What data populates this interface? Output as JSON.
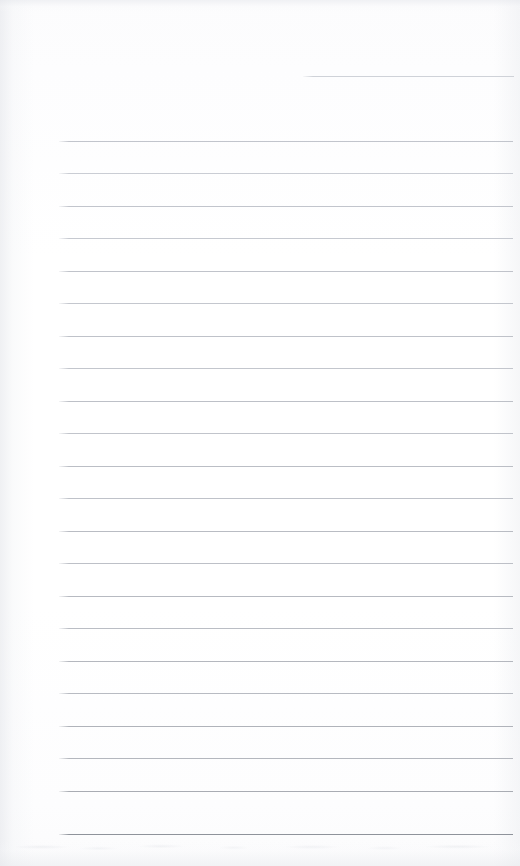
{
  "document": {
    "kind": "scanned-ruled-notepad-page",
    "page_label": "",
    "body_text": "",
    "width_px": 520,
    "height_px": 866,
    "background_color": "#ffffff",
    "paper_tone_color": "#fdfdfe",
    "rule_color": "#b9bcc4",
    "rule_color_dark": "#8f939b",
    "rule_color_light": "#cfd2d8"
  },
  "ruling": {
    "left_x": 59,
    "right_x": 512,
    "spacing_px": 32.5,
    "thickness_px": 1,
    "count": 23,
    "lines": [
      {
        "name": "rule-top-partial",
        "y": 76,
        "x": 303,
        "right": 514,
        "color": "#cfd2d8"
      },
      {
        "name": "rule-1",
        "y": 141,
        "x": 59,
        "right": 513,
        "color": "#c2c5cc"
      },
      {
        "name": "rule-2",
        "y": 173,
        "x": 59,
        "right": 513,
        "color": "#cacdd4"
      },
      {
        "name": "rule-3",
        "y": 206,
        "x": 59,
        "right": 513,
        "color": "#c2c5cc"
      },
      {
        "name": "rule-4",
        "y": 238,
        "x": 59,
        "right": 513,
        "color": "#c6c9d0"
      },
      {
        "name": "rule-5",
        "y": 271,
        "x": 59,
        "right": 513,
        "color": "#c0c3ca"
      },
      {
        "name": "rule-6",
        "y": 303,
        "x": 59,
        "right": 513,
        "color": "#c4c7ce"
      },
      {
        "name": "rule-7",
        "y": 336,
        "x": 59,
        "right": 513,
        "color": "#bfc2c9"
      },
      {
        "name": "rule-8",
        "y": 368,
        "x": 59,
        "right": 513,
        "color": "#c3c6cd"
      },
      {
        "name": "rule-9",
        "y": 401,
        "x": 59,
        "right": 513,
        "color": "#bdc0c7"
      },
      {
        "name": "rule-10",
        "y": 433,
        "x": 59,
        "right": 513,
        "color": "#c1c4cb"
      },
      {
        "name": "rule-11",
        "y": 466,
        "x": 59,
        "right": 513,
        "color": "#bbbec5"
      },
      {
        "name": "rule-12",
        "y": 498,
        "x": 59,
        "right": 513,
        "color": "#bfc2c9"
      },
      {
        "name": "rule-13",
        "y": 531,
        "x": 59,
        "right": 513,
        "color": "#b9bcc3"
      },
      {
        "name": "rule-14",
        "y": 563,
        "x": 59,
        "right": 513,
        "color": "#bdc0c7"
      },
      {
        "name": "rule-15",
        "y": 596,
        "x": 59,
        "right": 513,
        "color": "#b7bac1"
      },
      {
        "name": "rule-16",
        "y": 628,
        "x": 59,
        "right": 513,
        "color": "#babdc4"
      },
      {
        "name": "rule-17",
        "y": 661,
        "x": 59,
        "right": 513,
        "color": "#b4b7be"
      },
      {
        "name": "rule-18",
        "y": 693,
        "x": 59,
        "right": 513,
        "color": "#b8bbc2"
      },
      {
        "name": "rule-19",
        "y": 726,
        "x": 59,
        "right": 513,
        "color": "#b0b3ba"
      },
      {
        "name": "rule-20",
        "y": 758,
        "x": 59,
        "right": 513,
        "color": "#b4b7be"
      },
      {
        "name": "rule-21",
        "y": 791,
        "x": 59,
        "right": 513,
        "color": "#a9acb3"
      },
      {
        "name": "rule-22",
        "y": 834,
        "x": 59,
        "right": 513,
        "color": "#8f939b"
      }
    ]
  }
}
